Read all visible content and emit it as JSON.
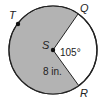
{
  "diagram": {
    "type": "circle-sector",
    "center": {
      "label": "S",
      "x": 53,
      "y": 50
    },
    "radius_px": 44,
    "points": [
      {
        "label": "T",
        "x": 18,
        "y": 24
      },
      {
        "label": "Q",
        "x": 78,
        "y": 14
      },
      {
        "label": "R",
        "x": 79,
        "y": 86
      }
    ],
    "angle_label": "105°",
    "radius_label": "8 in.",
    "colors": {
      "shaded": "#b3b3b3",
      "unshaded": "#ffffff",
      "stroke": "#222222"
    }
  }
}
